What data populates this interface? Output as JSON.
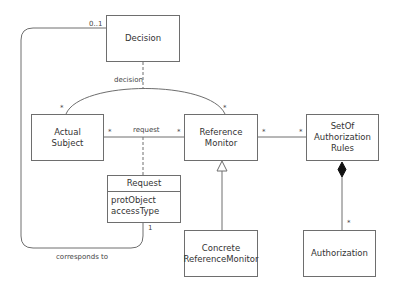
{
  "diagram": {
    "type": "UML class diagram",
    "classes": {
      "decision": {
        "name": "Decision"
      },
      "actual_subject": {
        "name": "Actual\nSubject"
      },
      "reference_monitor": {
        "name": "Reference\nMonitor"
      },
      "set_of_rules": {
        "name": "SetOf\nAuthorization\nRules"
      },
      "request": {
        "name": "Request",
        "attributes": [
          "protObject",
          "accessType"
        ]
      },
      "concrete_rm": {
        "name": "Concrete\nReferenceMonitor"
      },
      "authorization": {
        "name": "Authorization"
      }
    },
    "associations": {
      "decision_assoc": {
        "label": "decision",
        "mult_subject": "*",
        "mult_monitor": "*"
      },
      "request_assoc": {
        "label": "request",
        "mult_subject": "*",
        "mult_monitor": "*"
      },
      "rules_assoc": {
        "mult_monitor": "*",
        "mult_rules": "*"
      },
      "corresponds": {
        "label": "corresponds to",
        "mult_decision": "0..1",
        "mult_request": "1"
      },
      "composition": {
        "mult_authorization": "*"
      }
    },
    "colors": {
      "line": "#6e6e6e",
      "text": "#333333",
      "background": "#ffffff"
    }
  }
}
